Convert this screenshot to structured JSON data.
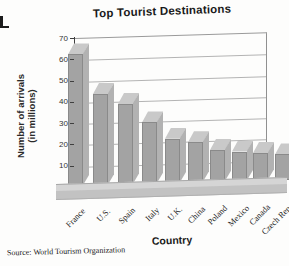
{
  "figure": {
    "title": "Top Tourist Destinations",
    "source": "Source: World Tourism Organization",
    "y_axis": {
      "label_line1": "Number of arrivals",
      "label_line2": "(in millions)"
    },
    "x_axis": {
      "label": "Country"
    }
  },
  "chart_data": {
    "type": "bar",
    "title": "Top Tourist Destinations",
    "xlabel": "Country",
    "ylabel": "Number of arrivals (in millions)",
    "categories": [
      "France",
      "U.S.",
      "Spain",
      "Italy",
      "U.K.",
      "China",
      "Poland",
      "Mexico",
      "Canada",
      "Czech Rep."
    ],
    "values": [
      67,
      48,
      43,
      34,
      26,
      24,
      20,
      19,
      18,
      17
    ],
    "ylim": [
      0,
      70
    ],
    "yticks": [
      0,
      10,
      20,
      30,
      40,
      50,
      60,
      70
    ],
    "grid": true,
    "legend": "none",
    "bar_style": "3d-gray",
    "source": "Source: World Tourism Organization"
  },
  "colors": {
    "background": "#fdfdfc",
    "bar_front": "#a3a3a3",
    "bar_top": "#c9c9c9",
    "bar_side": "#b2b2b2",
    "bar_edge": "#8a8a8a",
    "floor_top": "#d5d5d5",
    "floor_front": "#c2c2c2",
    "gridline": "#b3b3b3",
    "axis": "#3f3f3f",
    "text": "#1a1a1a"
  }
}
